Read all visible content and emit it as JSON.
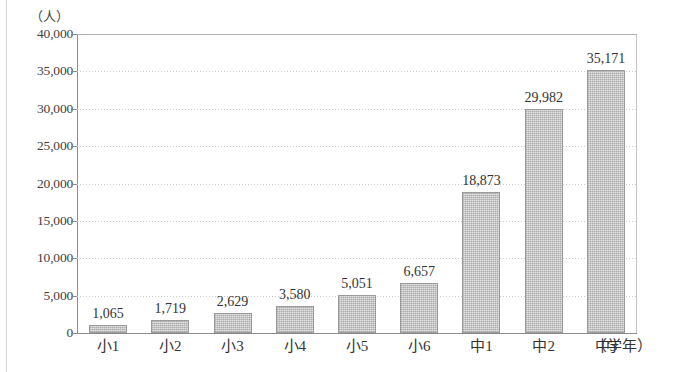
{
  "page": {
    "clipped_title_fragment": "",
    "y_unit_label": "（人）",
    "x_unit_label": "（学年）"
  },
  "chart_data": {
    "type": "bar",
    "title": "",
    "subtitle": "",
    "xlabel": "（学年）",
    "ylabel": "（人）",
    "categories": [
      "小1",
      "小2",
      "小3",
      "小4",
      "小5",
      "小6",
      "中1",
      "中2",
      "中3"
    ],
    "values": [
      1065,
      1719,
      2629,
      3580,
      5051,
      6657,
      18873,
      29982,
      35171
    ],
    "value_labels": [
      "1,065",
      "1,719",
      "2,629",
      "3,580",
      "5,051",
      "6,657",
      "18,873",
      "29,982",
      "35,171"
    ],
    "ylim": [
      0,
      40000
    ],
    "ytick_values": [
      0,
      5000,
      10000,
      15000,
      20000,
      25000,
      30000,
      35000,
      40000
    ],
    "ytick_labels": [
      "0",
      "5,000",
      "10,000",
      "15,000",
      "20,000",
      "25,000",
      "30,000",
      "35,000",
      "40,000"
    ],
    "grid": true,
    "grid_style": "dotted-horizontal",
    "legend": "none",
    "series": [
      {
        "name": "人数",
        "values": [
          1065,
          1719,
          2629,
          3580,
          5051,
          6657,
          18873,
          29982,
          35171
        ]
      }
    ],
    "bar_fill_color": "#e3e3e3",
    "bar_border_color": "#9a9a9a",
    "grid_color": "#c9c9c9",
    "axis_color": "#8c8c8c",
    "text_color": "#333333"
  }
}
